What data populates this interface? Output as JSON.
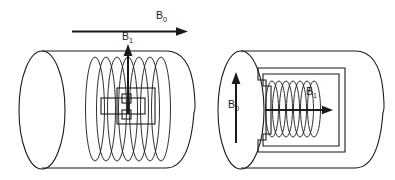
{
  "figure": {
    "background_color": "#ffffff",
    "line_color": "#1a1a1a"
  },
  "labels": {
    "b0_top": {
      "symbol": "B",
      "subscript": "0"
    },
    "b1_left": {
      "symbol": "B",
      "subscript": "1"
    },
    "b0_right_panel": {
      "symbol": "B",
      "subscript": "0"
    },
    "b1_right_panel": {
      "symbol": "B",
      "subscript": "1"
    }
  },
  "panels": [
    {
      "id": "left-panel",
      "name": "solenoid-parallel-bore",
      "bore": {
        "shape": "cylinder",
        "front_face": "full-ellipse",
        "right_end": "rounded-cap"
      },
      "coil": {
        "type": "solenoid",
        "turns": 7,
        "axis": "horizontal"
      },
      "sample": {
        "shape": "rectangle",
        "name": "sample-tube"
      },
      "holder": {
        "shape": "square-frame",
        "name": "coil-former"
      },
      "field_arrows": [
        {
          "name": "b1-arrow",
          "direction": "up",
          "label": "B1"
        }
      ]
    },
    {
      "id": "right-panel",
      "name": "solenoid-perpendicular-bore",
      "bore": {
        "shape": "cylinder",
        "front_face": "full-ellipse",
        "right_end": "rounded-cap"
      },
      "coil": {
        "type": "solenoid",
        "turns": 7,
        "axis": "horizontal"
      },
      "bracket": {
        "shape": "c-frame",
        "opening": "left",
        "name": "coil-support-bracket"
      },
      "field_arrows": [
        {
          "name": "b0-arrow",
          "direction": "up",
          "label": "B0"
        },
        {
          "name": "b1-arrow",
          "direction": "right",
          "label": "B1"
        }
      ]
    }
  ],
  "global_arrows": [
    {
      "name": "b0-main-arrow",
      "direction": "right",
      "label": "B0"
    }
  ]
}
